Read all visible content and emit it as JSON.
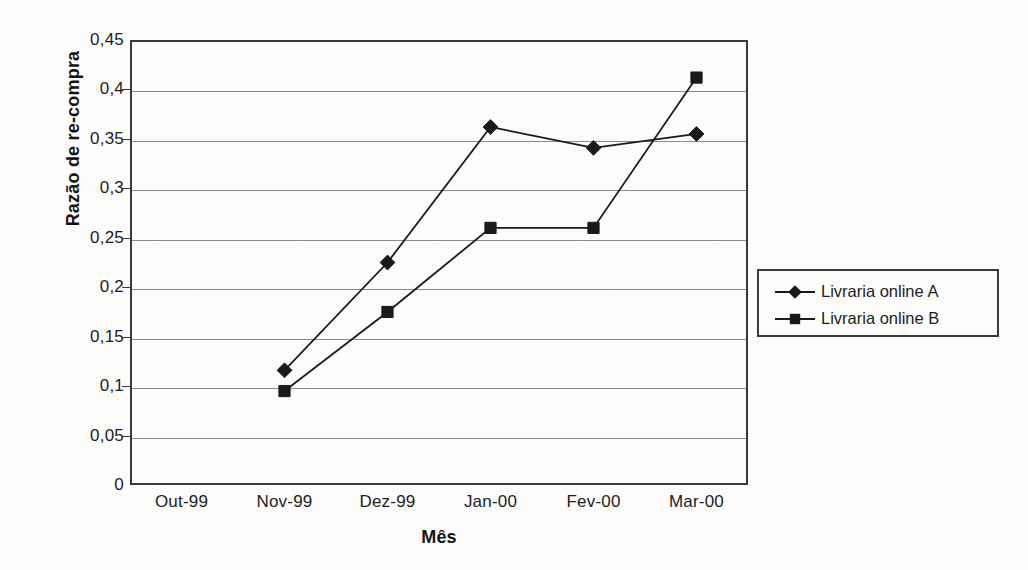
{
  "chart_data": {
    "type": "line",
    "title": "",
    "xlabel": "Mês",
    "ylabel": "Razão de re-compra",
    "categories": [
      "Out-99",
      "Nov-99",
      "Dez-99",
      "Jan-00",
      "Fev-00",
      "Mar-00"
    ],
    "series": [
      {
        "name": "Livraria online A",
        "marker": "diamond",
        "color": "#1a1a1a",
        "values": [
          null,
          0.116,
          0.225,
          0.362,
          0.341,
          0.355
        ]
      },
      {
        "name": "Livraria online B",
        "marker": "square",
        "color": "#1a1a1a",
        "values": [
          null,
          0.095,
          0.175,
          0.26,
          0.26,
          0.412
        ]
      }
    ],
    "ylim": [
      0,
      0.45
    ],
    "ytick_values": [
      0,
      0.05,
      0.1,
      0.15,
      0.2,
      0.25,
      0.3,
      0.35,
      0.4,
      0.45
    ],
    "ytick_labels": [
      "0",
      "0,05",
      "0,1",
      "0,15",
      "0,2",
      "0,25",
      "0,3",
      "0,35",
      "0,4",
      "0,45"
    ],
    "grid": true,
    "grid_axis": "y",
    "legend_position": "right"
  },
  "legend": {
    "items": [
      {
        "label": "Livraria online A",
        "marker": "diamond-marker-icon"
      },
      {
        "label": "Livraria online B",
        "marker": "square-marker-icon"
      }
    ]
  },
  "colors": {
    "axis": "#3a3a3a",
    "grid": "#8b8b8b",
    "series": "#1a1a1a",
    "text": "#1d1d1d",
    "background": "#fcfcfb"
  }
}
